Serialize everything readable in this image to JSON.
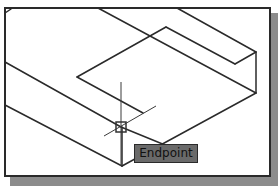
{
  "viewport": {
    "background": "#ffffff",
    "border_color": "#2a2a2a",
    "shadow_color": "#8c8c8c"
  },
  "drawing": {
    "line_color": "#2a2a2a",
    "object": "isometric-block-with-notch"
  },
  "cursor": {
    "type": "crosshair",
    "snap_marker": "endpoint-aperture-box",
    "position": [
      121,
      127
    ]
  },
  "tooltip": {
    "label": "Endpoint",
    "background": "#6a6a6a"
  }
}
